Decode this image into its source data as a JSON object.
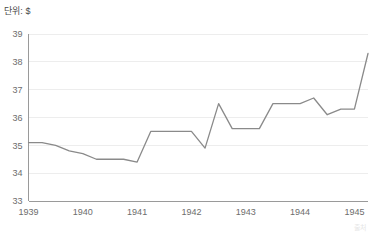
{
  "unit_label": "단위: $",
  "source_note": "출처",
  "colors": {
    "line": "#8a8a8a",
    "grid": "#ededed",
    "axis": "#9a9a9a",
    "tick_text": "#6d6d6d",
    "background": "#ffffff"
  },
  "chart_data": {
    "type": "line",
    "title": "",
    "subtitle": "",
    "xlabel": "",
    "ylabel": "단위: $",
    "ylim": [
      33,
      39
    ],
    "xlim": [
      1939.0,
      1945.25
    ],
    "grid": true,
    "legend": null,
    "yticks": [
      33,
      34,
      35,
      36,
      37,
      38,
      39
    ],
    "ytick_labels": [
      "33",
      "34",
      "35",
      "36",
      "37",
      "38",
      "39"
    ],
    "xticks": [
      1939,
      1940,
      1941,
      1942,
      1943,
      1944,
      1945
    ],
    "xtick_labels": [
      "1939",
      "1940",
      "1941",
      "1942",
      "1943",
      "1944",
      "1945"
    ],
    "series": [
      {
        "name": "value",
        "x": [
          1939.0,
          1939.25,
          1939.5,
          1939.75,
          1940.0,
          1940.25,
          1940.5,
          1940.75,
          1941.0,
          1941.25,
          1941.5,
          1941.75,
          1942.0,
          1942.25,
          1942.5,
          1942.75,
          1943.0,
          1943.25,
          1943.5,
          1943.75,
          1944.0,
          1944.25,
          1944.5,
          1944.75,
          1945.0,
          1945.25
        ],
        "values": [
          35.1,
          35.1,
          35.0,
          34.8,
          34.7,
          34.5,
          34.5,
          34.5,
          34.4,
          35.5,
          35.5,
          35.5,
          35.5,
          34.9,
          36.5,
          35.6,
          35.6,
          35.6,
          36.5,
          36.5,
          36.5,
          36.7,
          36.1,
          36.3,
          36.3,
          38.3
        ]
      }
    ]
  }
}
